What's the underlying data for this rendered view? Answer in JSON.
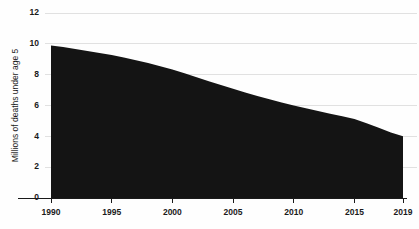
{
  "chart_data": {
    "type": "area",
    "title": "",
    "subtitle": "",
    "xlabel": "",
    "ylabel": "Millions of deaths under age 5",
    "xlim": [
      1990,
      2019
    ],
    "ylim": [
      0,
      12
    ],
    "grid": true,
    "legend": false,
    "series_color": "#141414",
    "background_color": "#fefefe",
    "gridline_color": "#d9d9d9",
    "axis_color": "#1a1a1a",
    "ytick_labels": [
      "0",
      "2",
      "4",
      "6",
      "8",
      "10",
      "12"
    ],
    "ytick_values": [
      0,
      2,
      4,
      6,
      8,
      10,
      12
    ],
    "xtick_labels": [
      "1990",
      "1995",
      "2000",
      "2005",
      "2010",
      "2015",
      "2019"
    ],
    "xtick_values": [
      1990,
      1995,
      2000,
      2005,
      2010,
      2015,
      2019
    ],
    "x": [
      1990,
      1991,
      1992,
      1993,
      1994,
      1995,
      1996,
      1997,
      1998,
      1999,
      2000,
      2001,
      2002,
      2003,
      2004,
      2005,
      2006,
      2007,
      2008,
      2009,
      2010,
      2011,
      2012,
      2013,
      2014,
      2015,
      2016,
      2017,
      2018,
      2019
    ],
    "values": [
      9.9,
      9.8,
      9.66,
      9.53,
      9.41,
      9.28,
      9.12,
      8.94,
      8.75,
      8.55,
      8.33,
      8.09,
      7.84,
      7.58,
      7.33,
      7.09,
      6.85,
      6.62,
      6.4,
      6.2,
      6.0,
      5.82,
      5.64,
      5.47,
      5.3,
      5.12,
      4.85,
      4.55,
      4.25,
      4.0
    ],
    "series": [
      {
        "name": "Deaths under age 5",
        "values": [
          9.9,
          9.8,
          9.66,
          9.53,
          9.41,
          9.28,
          9.12,
          8.94,
          8.75,
          8.55,
          8.33,
          8.09,
          7.84,
          7.58,
          7.33,
          7.09,
          6.85,
          6.62,
          6.4,
          6.2,
          6.0,
          5.82,
          5.64,
          5.47,
          5.3,
          5.12,
          4.85,
          4.55,
          4.25,
          4.0
        ]
      }
    ]
  }
}
